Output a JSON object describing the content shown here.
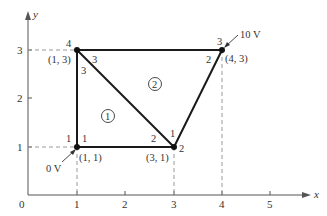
{
  "figure": {
    "axes": {
      "x_label": "x",
      "y_label": "y",
      "origin_label": "0",
      "x_ticks": [
        "1",
        "2",
        "3",
        "4",
        "5"
      ],
      "y_ticks": [
        "1",
        "2",
        "3"
      ]
    },
    "nodes": [
      {
        "global": "1",
        "coord": "(1, 1)",
        "x": 1,
        "y": 1
      },
      {
        "global": "2",
        "coord": "(3, 1)",
        "x": 3,
        "y": 1
      },
      {
        "global": "3",
        "coord": "(4, 3)",
        "x": 4,
        "y": 3
      },
      {
        "global": "4",
        "coord": "(1, 3)",
        "x": 1,
        "y": 3
      }
    ],
    "elements": [
      {
        "label": "1",
        "local_nodes": {
          "at_node1": "1",
          "at_node2": "2",
          "at_node4": "3"
        }
      },
      {
        "label": "2",
        "local_nodes": {
          "at_node2": "1",
          "at_node3": "2",
          "at_node4": "3"
        }
      }
    ],
    "boundary_conditions": [
      {
        "label": "0 V",
        "node": "1"
      },
      {
        "label": "10 V",
        "node": "3"
      }
    ]
  }
}
